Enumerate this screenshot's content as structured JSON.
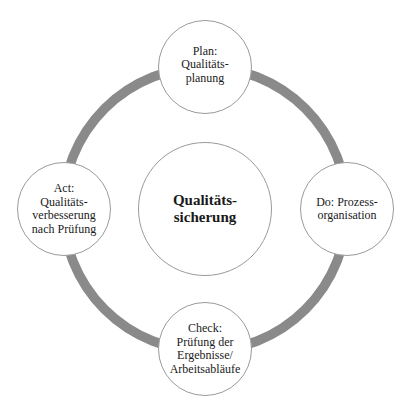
{
  "diagram": {
    "type": "cycle",
    "ring_color": "#8a8a8a",
    "center": {
      "label": "Qualitäts-\nsicherung"
    },
    "nodes": [
      {
        "position": "top",
        "label": "Plan:\nQualitäts-\nplanung"
      },
      {
        "position": "right",
        "label": "Do: Prozess-\norganisation"
      },
      {
        "position": "bottom",
        "label": "Check:\nPrüfung der\nErgebnisse/\nArbeitsabläufe"
      },
      {
        "position": "left",
        "label": "Act:\nQualitäts-\nverbesserung\nnach Prüfung"
      }
    ]
  }
}
